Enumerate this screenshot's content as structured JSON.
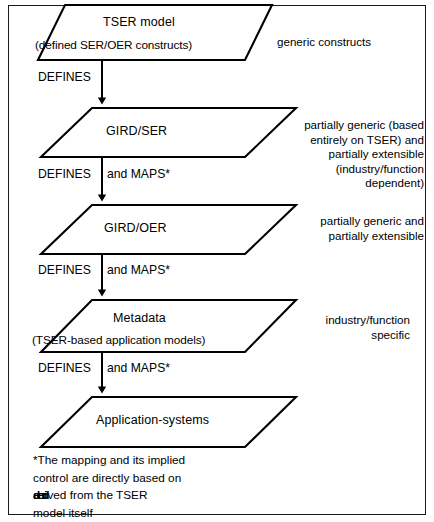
{
  "figure": {
    "frame_color": "#1a1a1a",
    "background": "#ffffff",
    "line_color": "#000000"
  },
  "nodes": [
    {
      "id": "tser-model",
      "title": "TSER model",
      "subtitle": "(defined SER/OER constructs)",
      "annotation_lines": [
        "generic constructs"
      ],
      "annotation_align": "left"
    },
    {
      "id": "gird-ser",
      "title": "GIRD/SER",
      "subtitle": "",
      "annotation_lines": [
        "partially generic (based",
        "entirely on TSER) and",
        "partially extensible",
        "(industry/function",
        "dependent)"
      ],
      "annotation_align": "right"
    },
    {
      "id": "gird-oer",
      "title": "GIRD/OER",
      "subtitle": "",
      "annotation_lines": [
        "partially generic and",
        "partially extensible"
      ],
      "annotation_align": "right"
    },
    {
      "id": "metadata",
      "title": "Metadata",
      "subtitle": "(TSER-based application models)",
      "annotation_lines": [
        "industry/function",
        "specific"
      ],
      "annotation_align": "right"
    },
    {
      "id": "application-systems",
      "title": "Application-systems",
      "subtitle": "",
      "annotation_lines": [],
      "annotation_align": "left"
    }
  ],
  "edges": [
    {
      "id": "edge-1",
      "left_label": "DEFINES",
      "right_label": ""
    },
    {
      "id": "edge-2",
      "left_label": "DEFINES",
      "right_label": "and MAPS*"
    },
    {
      "id": "edge-3",
      "left_label": "DEFINES",
      "right_label": "and MAPS*"
    },
    {
      "id": "edge-4",
      "left_label": "DEFINES",
      "right_label": "and MAPS*"
    }
  ],
  "footnote": {
    "line1": "*The mapping and its implied",
    "line2": "control are directly based on",
    "line3_struck_under": "and",
    "line3_struck_over": "deri",
    "line3_rest": "ved from the TSER",
    "line4": "model itself"
  }
}
